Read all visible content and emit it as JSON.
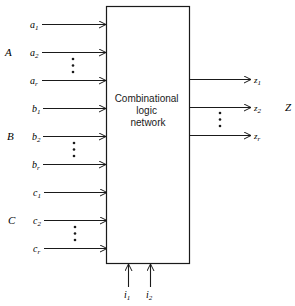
{
  "block": {
    "label_lines": [
      "Combinational",
      "logic",
      "network"
    ]
  },
  "input_groups": [
    {
      "group": "A",
      "signals": [
        {
          "base": "a",
          "sub": "1"
        },
        {
          "base": "a",
          "sub": "2"
        },
        {
          "base": "a",
          "sub": "r"
        }
      ]
    },
    {
      "group": "B",
      "signals": [
        {
          "base": "b",
          "sub": "1"
        },
        {
          "base": "b",
          "sub": "2"
        },
        {
          "base": "b",
          "sub": "r"
        }
      ]
    },
    {
      "group": "C",
      "signals": [
        {
          "base": "c",
          "sub": "1"
        },
        {
          "base": "c",
          "sub": "2"
        },
        {
          "base": "c",
          "sub": "r"
        }
      ]
    }
  ],
  "output_group": {
    "group": "Z",
    "signals": [
      {
        "base": "z",
        "sub": "1"
      },
      {
        "base": "z",
        "sub": "2"
      },
      {
        "base": "z",
        "sub": "r"
      }
    ]
  },
  "control_inputs": [
    {
      "base": "i",
      "sub": "1"
    },
    {
      "base": "i",
      "sub": "2"
    }
  ],
  "colors": {
    "stroke": "#1a1a1a",
    "background": "#ffffff"
  }
}
